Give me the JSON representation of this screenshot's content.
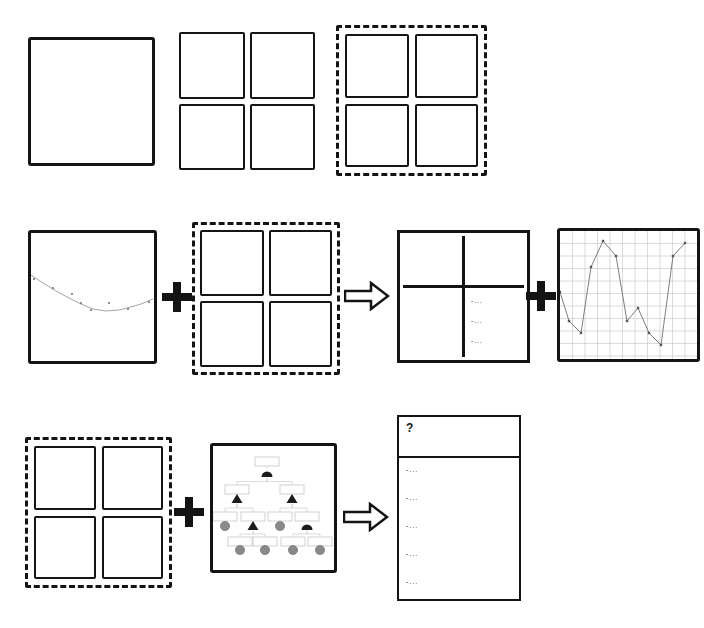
{
  "symbols": {
    "plus": "+",
    "arrow": "right-arrow"
  },
  "colors": {
    "ink": "#141414",
    "tree_node_gray": "#8a8a8a",
    "tree_node_black": "#1c1c1c",
    "tree_line": "#cccccc",
    "chart_grid": "#c2c2c2"
  },
  "result_panel": {
    "header_label": "?",
    "items": [
      "-...",
      "-...",
      "-...",
      "-...",
      "-..."
    ]
  },
  "quadrant_panel": {
    "patterns": [
      "diagonal-hatch",
      "fish-scales",
      "stipple-dots",
      "text-list"
    ],
    "list_items": [
      "-...",
      "-...",
      "-..."
    ]
  },
  "charts": {
    "scatter_curve": {
      "type": "scatter",
      "curve": [
        [
          0,
          42
        ],
        [
          12,
          50
        ],
        [
          25,
          58
        ],
        [
          38,
          65
        ],
        [
          50,
          71
        ],
        [
          62,
          76
        ],
        [
          75,
          78
        ],
        [
          88,
          77
        ],
        [
          100,
          74
        ],
        [
          110,
          71
        ],
        [
          122,
          66
        ]
      ],
      "points": [
        [
          3,
          46
        ],
        [
          22,
          55
        ],
        [
          41,
          61
        ],
        [
          50,
          70
        ],
        [
          60,
          77
        ],
        [
          78,
          70
        ],
        [
          97,
          76
        ],
        [
          118,
          69
        ]
      ],
      "curve_color": "#9a9a9a",
      "point_color": "#777777"
    },
    "zigzag": {
      "type": "line",
      "grid_step": 12.5,
      "grid_color": "#c2c2c2",
      "points": [
        [
          0,
          61
        ],
        [
          9,
          90
        ],
        [
          21,
          102
        ],
        [
          31,
          36
        ],
        [
          43,
          10
        ],
        [
          56,
          25
        ],
        [
          67,
          90
        ],
        [
          78,
          77
        ],
        [
          89,
          102
        ],
        [
          101,
          114
        ],
        [
          113,
          25
        ],
        [
          125,
          12
        ]
      ],
      "line_color": "#6f6f6f",
      "marker_color": "#555555"
    }
  },
  "tree": {
    "box_color": "#c6c6c6",
    "line_color": "#cccccc",
    "gray": "#8a8a8a",
    "black": "#1c1c1c",
    "levels": [
      {
        "box_y": 11,
        "shape_y": 27,
        "nodes": [
          {
            "x": 54,
            "shape": "dome"
          }
        ]
      },
      {
        "box_y": 39,
        "shape_y": 53,
        "nodes": [
          {
            "x": 24,
            "shape": "triangle"
          },
          {
            "x": 79,
            "shape": "triangle"
          }
        ]
      },
      {
        "box_y": 66,
        "shape_y": 80,
        "nodes": [
          {
            "x": 12,
            "shape": "circle"
          },
          {
            "x": 40,
            "shape": "triangle"
          },
          {
            "x": 67,
            "shape": "circle"
          },
          {
            "x": 94,
            "shape": "dome"
          }
        ]
      },
      {
        "box_y": 91,
        "shape_y": 104,
        "nodes": [
          {
            "x": 27,
            "shape": "circle"
          },
          {
            "x": 52,
            "shape": "circle"
          },
          {
            "x": 80,
            "shape": "circle"
          },
          {
            "x": 107,
            "shape": "circle"
          }
        ]
      }
    ],
    "edges": [
      [
        0,
        0,
        1,
        0
      ],
      [
        0,
        0,
        1,
        1
      ],
      [
        1,
        0,
        2,
        0
      ],
      [
        1,
        0,
        2,
        1
      ],
      [
        1,
        1,
        2,
        2
      ],
      [
        1,
        1,
        2,
        3
      ],
      [
        2,
        1,
        3,
        0
      ],
      [
        2,
        1,
        3,
        1
      ],
      [
        2,
        3,
        3,
        2
      ],
      [
        2,
        3,
        3,
        3
      ]
    ]
  }
}
